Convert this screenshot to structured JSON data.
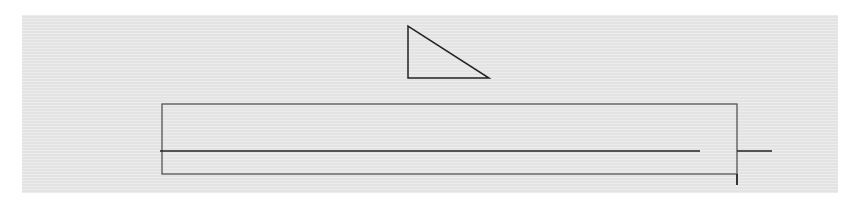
{
  "diagram": {
    "background_color": "#e8e8e8",
    "stroke_color": "#222222",
    "rect_stroke_color": "#555555",
    "shapes": {
      "triangle": {
        "points": "408,26 408,78 489,78"
      },
      "rectangle": {
        "x": 162,
        "y": 104,
        "width": 575,
        "height": 70
      },
      "line_main": {
        "x1": 160,
        "y1": 151,
        "x2": 700,
        "y2": 151
      },
      "line_right": {
        "x1": 737,
        "y1": 151,
        "x2": 772,
        "y2": 151
      },
      "tick_right": {
        "x1": 737,
        "y1": 174,
        "x2": 737,
        "y2": 185
      }
    }
  }
}
